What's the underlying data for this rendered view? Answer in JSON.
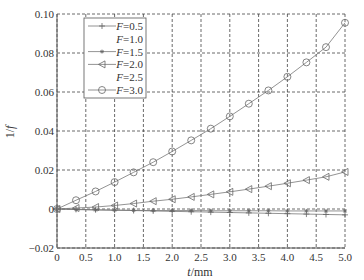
{
  "chart_data": {
    "type": "line",
    "title": "",
    "xlabel": "t/mm",
    "ylabel": "1/f",
    "xlim": [
      0,
      5.0
    ],
    "ylim": [
      -0.02,
      0.1
    ],
    "xticks": [
      "0",
      "0.5",
      "1.0",
      "1.5",
      "2.0",
      "2.5",
      "3.0",
      "3.5",
      "4.0",
      "4.5",
      "5.0"
    ],
    "yticks": [
      "-0.02",
      "0",
      "0.02",
      "0.04",
      "0.06",
      "0.08",
      "0.10"
    ],
    "grid": true,
    "legend_position": "upper left",
    "series": [
      {
        "name": "F=0.5",
        "marker": "+",
        "x": [
          0,
          0.33,
          0.67,
          1.0,
          1.33,
          1.67,
          2.0,
          2.33,
          2.67,
          3.0,
          3.33,
          3.67,
          4.0,
          4.33,
          4.67,
          5.0
        ],
        "values": [
          0,
          -0.0002,
          -0.0004,
          -0.0006,
          -0.0008,
          -0.001,
          -0.0012,
          -0.0014,
          -0.0016,
          -0.0018,
          -0.002,
          -0.0022,
          -0.0024,
          -0.0026,
          -0.0028,
          -0.003
        ]
      },
      {
        "name": "F=1.0",
        "marker": "none",
        "x": [],
        "values": []
      },
      {
        "name": "F=1.5",
        "marker": "*",
        "x": [
          0,
          0.33,
          0.67,
          1.0,
          1.33,
          1.67,
          2.0,
          2.33,
          2.67,
          3.0,
          3.33,
          3.67,
          4.0,
          4.33,
          4.67,
          5.0
        ],
        "values": [
          0,
          -0.0003,
          -0.0005,
          -0.0006,
          -0.0007,
          -0.0008,
          -0.0008,
          -0.0008,
          -0.0009,
          -0.0009,
          -0.0009,
          -0.0009,
          -0.001,
          -0.001,
          -0.001,
          -0.001
        ]
      },
      {
        "name": "F=2.0",
        "marker": "<",
        "x": [
          0,
          0.33,
          0.67,
          1.0,
          1.33,
          1.67,
          2.0,
          2.33,
          2.67,
          3.0,
          3.33,
          3.67,
          4.0,
          4.33,
          4.67,
          5.0
        ],
        "values": [
          0,
          0.0005,
          0.001,
          0.0018,
          0.0028,
          0.004,
          0.005,
          0.0062,
          0.0075,
          0.0088,
          0.0102,
          0.0117,
          0.0132,
          0.0148,
          0.0165,
          0.019
        ]
      },
      {
        "name": "F=2.5",
        "marker": "none",
        "x": [],
        "values": []
      },
      {
        "name": "F=3.0",
        "marker": "o",
        "x": [
          0,
          0.33,
          0.67,
          1.0,
          1.33,
          1.67,
          2.0,
          2.33,
          2.67,
          3.0,
          3.33,
          3.67,
          4.0,
          4.33,
          4.67,
          5.0
        ],
        "values": [
          0,
          0.0045,
          0.009,
          0.0138,
          0.0188,
          0.024,
          0.0295,
          0.0352,
          0.0412,
          0.0475,
          0.054,
          0.0608,
          0.0678,
          0.0752,
          0.083,
          0.0955
        ]
      }
    ]
  },
  "legend": {
    "items": [
      {
        "label_prefix": "F",
        "label_suffix": "=0.5"
      },
      {
        "label_prefix": "F",
        "label_suffix": "=1.0"
      },
      {
        "label_prefix": "F",
        "label_suffix": "=1.5"
      },
      {
        "label_prefix": "F",
        "label_suffix": "=2.0"
      },
      {
        "label_prefix": "F",
        "label_suffix": "=2.5"
      },
      {
        "label_prefix": "F",
        "label_suffix": "=3.0"
      }
    ]
  },
  "axes": {
    "xlabel_italic": "t",
    "xlabel_unit": "/mm",
    "ylabel_prefix": "1/",
    "ylabel_italic": "f"
  }
}
